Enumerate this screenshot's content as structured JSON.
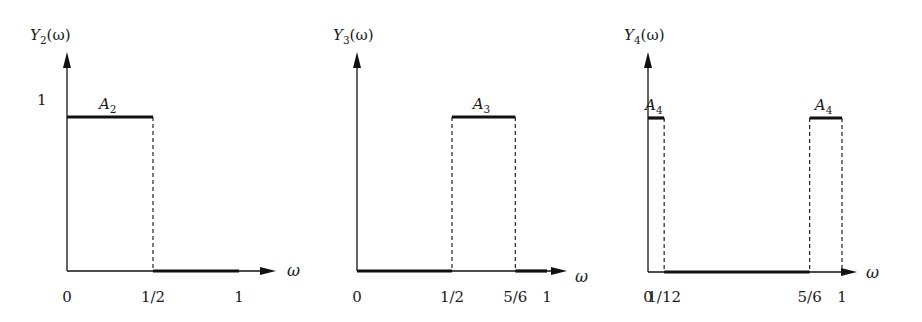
{
  "figure": {
    "panels": [
      {
        "id": "Y2",
        "ylabel": "Y",
        "ylabel_sub": "2",
        "ylabel_arg": "(ω)",
        "xlabel": "ω",
        "one_label": "1",
        "ticks": [
          {
            "label": "0",
            "x": 0
          },
          {
            "label": "1/2",
            "x": 0.5
          },
          {
            "label": "1",
            "x": 1
          }
        ],
        "segments_high": [
          {
            "from": 0,
            "to": 0.5,
            "label": "A",
            "label_sub": "2"
          }
        ],
        "segments_low": [
          {
            "from": 0.5,
            "to": 1
          }
        ],
        "dashed": [
          0.5
        ]
      },
      {
        "id": "Y3",
        "ylabel": "Y",
        "ylabel_sub": "3",
        "ylabel_arg": "(ω)",
        "xlabel": "ω",
        "one_label": "",
        "ticks": [
          {
            "label": "0",
            "x": 0
          },
          {
            "label": "1/2",
            "x": 0.5
          },
          {
            "label": "5/6",
            "x": 0.8333
          },
          {
            "label": "1",
            "x": 1
          }
        ],
        "segments_high": [
          {
            "from": 0.5,
            "to": 0.8333,
            "label": "A",
            "label_sub": "3"
          }
        ],
        "segments_low": [
          {
            "from": 0,
            "to": 0.5
          },
          {
            "from": 0.8333,
            "to": 1
          }
        ],
        "dashed": [
          0.5,
          0.8333
        ]
      },
      {
        "id": "Y4",
        "ylabel": "Y",
        "ylabel_sub": "4",
        "ylabel_arg": "(ω)",
        "xlabel": "ω",
        "one_label": "",
        "ticks": [
          {
            "label": "0",
            "x": 0
          },
          {
            "label": "1/12",
            "x": 0.0833
          },
          {
            "label": "5/6",
            "x": 0.8333
          },
          {
            "label": "1",
            "x": 1
          }
        ],
        "segments_high": [
          {
            "from": 0,
            "to": 0.0833,
            "label": "A",
            "label_sub": "4"
          },
          {
            "from": 0.8333,
            "to": 1,
            "label": "A",
            "label_sub": "4"
          }
        ],
        "segments_low": [
          {
            "from": 0.0833,
            "to": 0.8333
          }
        ],
        "dashed": [
          0.0833,
          0.8333,
          1
        ]
      }
    ]
  },
  "chart_data": [
    {
      "type": "line",
      "title": "Y2(ω)",
      "xlabel": "ω",
      "ylabel": "Y2(ω)",
      "x": [
        0,
        0.5,
        0.5,
        1
      ],
      "values": [
        1,
        1,
        0,
        0
      ],
      "annotations": [
        "A2 over [0, 1/2]"
      ],
      "xticks": [
        "0",
        "1/2",
        "1"
      ],
      "yticks": [
        "1"
      ],
      "xlim": [
        0,
        1
      ],
      "ylim": [
        0,
        1
      ],
      "grid": false
    },
    {
      "type": "line",
      "title": "Y3(ω)",
      "xlabel": "ω",
      "ylabel": "Y3(ω)",
      "x": [
        0,
        0.5,
        0.5,
        0.8333,
        0.8333,
        1
      ],
      "values": [
        0,
        0,
        1,
        1,
        0,
        0
      ],
      "annotations": [
        "A3 over [1/2, 5/6]"
      ],
      "xticks": [
        "0",
        "1/2",
        "5/6",
        "1"
      ],
      "xlim": [
        0,
        1
      ],
      "ylim": [
        0,
        1
      ],
      "grid": false
    },
    {
      "type": "line",
      "title": "Y4(ω)",
      "xlabel": "ω",
      "ylabel": "Y4(ω)",
      "x": [
        0,
        0.0833,
        0.0833,
        0.8333,
        0.8333,
        1
      ],
      "values": [
        1,
        1,
        0,
        0,
        1,
        1
      ],
      "annotations": [
        "A4 over [0, 1/12]",
        "A4 over [5/6, 1]"
      ],
      "xticks": [
        "0",
        "1/12",
        "5/6",
        "1"
      ],
      "xlim": [
        0,
        1
      ],
      "ylim": [
        0,
        1
      ],
      "grid": false
    }
  ]
}
